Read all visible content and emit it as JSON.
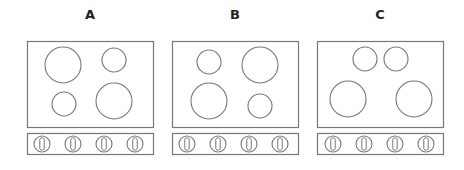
{
  "diagram": {
    "type": "stove-top-layouts",
    "stroke_color": "#777777",
    "label_color": "#222222",
    "options": [
      {
        "label": "A",
        "label_x": 90,
        "cooktop": {
          "x": 27,
          "y": 41,
          "w": 126,
          "h": 86
        },
        "burners": [
          {
            "cx": 63,
            "cy": 65,
            "r": 18,
            "size": "large",
            "position": "top-left"
          },
          {
            "cx": 114,
            "cy": 60,
            "r": 12,
            "size": "small",
            "position": "top-right"
          },
          {
            "cx": 64,
            "cy": 104,
            "r": 12,
            "size": "small",
            "position": "bottom-left"
          },
          {
            "cx": 114,
            "cy": 101,
            "r": 18,
            "size": "large",
            "position": "bottom-right"
          }
        ],
        "knob_bar": {
          "x": 27,
          "y": 133,
          "w": 126,
          "h": 21
        },
        "knobs": [
          42,
          73,
          104,
          135
        ]
      },
      {
        "label": "B",
        "label_x": 235,
        "cooktop": {
          "x": 172,
          "y": 41,
          "w": 126,
          "h": 86
        },
        "burners": [
          {
            "cx": 209,
            "cy": 62,
            "r": 12,
            "size": "small",
            "position": "top-left"
          },
          {
            "cx": 260,
            "cy": 65,
            "r": 18,
            "size": "large",
            "position": "top-right"
          },
          {
            "cx": 209,
            "cy": 101,
            "r": 18,
            "size": "large",
            "position": "bottom-left"
          },
          {
            "cx": 260,
            "cy": 106,
            "r": 12,
            "size": "small",
            "position": "bottom-right"
          }
        ],
        "knob_bar": {
          "x": 172,
          "y": 133,
          "w": 126,
          "h": 21
        },
        "knobs": [
          187,
          218,
          249,
          280
        ]
      },
      {
        "label": "C",
        "label_x": 380,
        "cooktop": {
          "x": 317,
          "y": 41,
          "w": 126,
          "h": 86
        },
        "burners": [
          {
            "cx": 365,
            "cy": 59,
            "r": 12,
            "size": "small",
            "position": "top-center-left"
          },
          {
            "cx": 396,
            "cy": 59,
            "r": 12,
            "size": "small",
            "position": "top-center-right"
          },
          {
            "cx": 348,
            "cy": 99,
            "r": 18,
            "size": "large",
            "position": "bottom-left"
          },
          {
            "cx": 414,
            "cy": 99,
            "r": 18,
            "size": "large",
            "position": "bottom-right"
          }
        ],
        "knob_bar": {
          "x": 317,
          "y": 133,
          "w": 126,
          "h": 21
        },
        "knobs": [
          333,
          364,
          395,
          426
        ]
      }
    ]
  }
}
